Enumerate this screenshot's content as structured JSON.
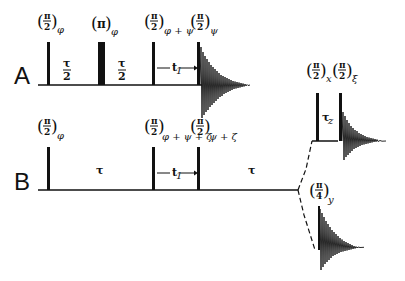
{
  "figure": {
    "type": "NMR pulse sequence diagram",
    "rows": [
      {
        "label": "A",
        "pulses": [
          {
            "angle_num": "π",
            "angle_den": "2",
            "phase": "φ",
            "x": 47,
            "width": 3
          },
          {
            "angle_num": "π",
            "angle_den": "",
            "phase": "φ",
            "x": 100,
            "width": 6
          },
          {
            "angle_num": "π",
            "angle_den": "2",
            "phase": "φ+ψ",
            "x": 153,
            "width": 3
          },
          {
            "angle_num": "π",
            "angle_den": "2",
            "phase": "ψ",
            "x": 198,
            "width": 3
          }
        ],
        "intervals": [
          {
            "num": "τ",
            "den": "2"
          },
          {
            "num": "τ",
            "den": "2"
          },
          {
            "label": "t",
            "sub": "1"
          }
        ],
        "acquisition": "FID"
      },
      {
        "label": "B",
        "pulses": [
          {
            "angle_num": "π",
            "angle_den": "2",
            "phase": "φ",
            "x": 47
          },
          {
            "angle_num": "π",
            "angle_den": "2",
            "phase": "φ+ψ+ζ",
            "x": 153
          },
          {
            "angle_num": "π",
            "angle_den": "2",
            "phase": "ψ+ζ",
            "x": 198
          }
        ],
        "intervals": [
          {
            "label": "τ"
          },
          {
            "label": "t",
            "sub": "1"
          },
          {
            "label": "τ"
          }
        ],
        "branches": [
          {
            "pulses": [
              {
                "angle_num": "π",
                "angle_den": "2",
                "phase": "x"
              },
              {
                "angle_num": "π",
                "angle_den": "2",
                "phase": "ξ"
              }
            ],
            "interval": {
              "label": "τ",
              "sub": "z"
            },
            "acquisition": "FID"
          },
          {
            "pulses": [
              {
                "angle_num": "π",
                "angle_den": "4",
                "phase": "y"
              }
            ],
            "acquisition": "FID"
          }
        ]
      }
    ]
  },
  "labels": {
    "row_a": "A",
    "row_b": "B",
    "pi": "π",
    "two": "2",
    "four": "4",
    "tau": "τ",
    "t1": "t",
    "t1_sub": "1",
    "tau_z_sub": "z",
    "phase_phi": "φ",
    "phase_phi_psi": "φ + ψ",
    "phase_psi": "ψ",
    "phase_phi_psi_zeta": "φ + ψ + ζ",
    "phase_psi_zeta": "ψ + ζ",
    "phase_x": "x",
    "phase_xi": "ξ",
    "phase_y": "y",
    "open_paren": "(",
    "close_paren": ")"
  }
}
